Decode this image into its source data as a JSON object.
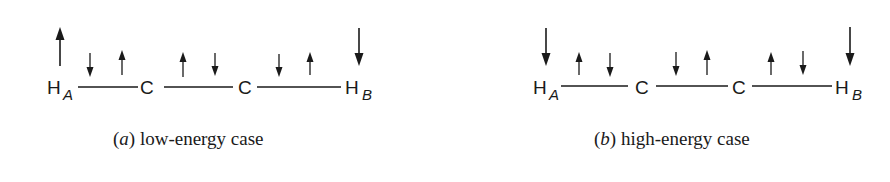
{
  "panels": [
    {
      "id": "a",
      "caption_letter": "a",
      "caption_text": "low-energy case",
      "atoms": [
        "H",
        "C",
        "C",
        "H"
      ],
      "subscripts": [
        "A",
        "",
        "",
        "B"
      ],
      "terminal_spins": {
        "H_A": "up",
        "H_B": "down"
      },
      "bond_spins": [
        {
          "bond": "H_A-C",
          "spins": [
            "down",
            "up"
          ]
        },
        {
          "bond": "C-C",
          "spins": [
            "up",
            "down"
          ]
        },
        {
          "bond": "C-H_B",
          "spins": [
            "down",
            "up"
          ]
        }
      ]
    },
    {
      "id": "b",
      "caption_letter": "b",
      "caption_text": "high-energy case",
      "atoms": [
        "H",
        "C",
        "C",
        "H"
      ],
      "subscripts": [
        "A",
        "",
        "",
        "B"
      ],
      "terminal_spins": {
        "H_A": "down",
        "H_B": "down"
      },
      "bond_spins": [
        {
          "bond": "H_A-C",
          "spins": [
            "up",
            "down"
          ]
        },
        {
          "bond": "C-C",
          "spins": [
            "down",
            "up"
          ]
        },
        {
          "bond": "C-H_B",
          "spins": [
            "up",
            "down"
          ]
        }
      ]
    }
  ],
  "captions": {
    "a_open": "(",
    "a_letter": "a",
    "a_close": ")",
    "a_text": "low-energy case",
    "b_open": "(",
    "b_letter": "b",
    "b_close": ")",
    "b_text": "high-energy case"
  },
  "labels": {
    "H": "H",
    "C": "C",
    "sub_A": "A",
    "sub_B": "B"
  },
  "colors": {
    "ink": "#1a1a1a",
    "background": "#ffffff"
  }
}
